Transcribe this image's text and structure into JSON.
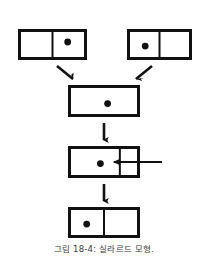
{
  "figure": {
    "caption": "그림 18-4: 실라르드 모형.",
    "stroke_color": "#111111",
    "background_color": "#ffffff",
    "particle_color": "#111111",
    "arrow_color": "#111111",
    "boxes": [
      {
        "id": "box-top-left",
        "label": "top-left-chamber",
        "x": 18,
        "y": 29,
        "width": 69,
        "height": 31,
        "divider": 0.5,
        "particle_side": "right",
        "particle_cx": 0.72,
        "particle_cy": 0.42
      },
      {
        "id": "box-top-right",
        "label": "top-right-chamber",
        "x": 127,
        "y": 29,
        "width": 65,
        "height": 31,
        "divider": 0.5,
        "particle_side": "left",
        "particle_cx": 0.28,
        "particle_cy": 0.55
      },
      {
        "id": "box-middle",
        "label": "merged-chamber-no-divider",
        "x": 68,
        "y": 85,
        "width": 72,
        "height": 32,
        "divider": null,
        "particle_side": "center",
        "particle_cx": 0.55,
        "particle_cy": 0.58
      },
      {
        "id": "box-piston",
        "label": "chamber-with-piston",
        "x": 68,
        "y": 146,
        "width": 72,
        "height": 32,
        "divider": 0.72,
        "particle_side": "left",
        "particle_cx": 0.45,
        "particle_cy": 0.55
      },
      {
        "id": "box-bottom",
        "label": "final-chamber",
        "x": 68,
        "y": 207,
        "width": 72,
        "height": 31,
        "divider": 0.5,
        "particle_side": "left",
        "particle_cx": 0.26,
        "particle_cy": 0.55
      }
    ],
    "arrows": [
      {
        "id": "arrow-diagonal-left",
        "label": "diagonal-arrow-from-top-left",
        "x1": 57,
        "y1": 66,
        "x2": 73,
        "y2": 79,
        "type": "diagonal"
      },
      {
        "id": "arrow-diagonal-right",
        "label": "diagonal-arrow-from-top-right",
        "x1": 152,
        "y1": 66,
        "x2": 136,
        "y2": 79,
        "type": "diagonal"
      },
      {
        "id": "arrow-down-1",
        "label": "downward-arrow-middle-to-piston",
        "x1": 104,
        "y1": 123,
        "x2": 104,
        "y2": 140,
        "type": "vertical"
      },
      {
        "id": "arrow-left-piston",
        "label": "horizontal-piston-push-arrow",
        "x1": 162,
        "y1": 162,
        "x2": 114,
        "y2": 162,
        "type": "horizontal"
      },
      {
        "id": "arrow-down-2",
        "label": "downward-arrow-piston-to-final",
        "x1": 104,
        "y1": 184,
        "x2": 104,
        "y2": 201,
        "type": "vertical"
      }
    ]
  }
}
